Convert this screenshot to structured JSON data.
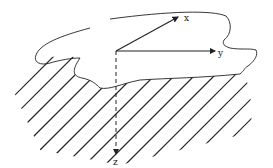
{
  "diagram": {
    "type": "coordinate-system-over-surface",
    "axes": [
      {
        "name": "x",
        "label": "x",
        "style": "solid"
      },
      {
        "name": "y",
        "label": "y",
        "style": "solid"
      },
      {
        "name": "z",
        "label": "z",
        "style": "dashed"
      }
    ],
    "region": {
      "description": "irregular free-surface outline above hatched solid half-space"
    },
    "colors": {
      "stroke": "#222222",
      "background": "#ffffff"
    }
  }
}
